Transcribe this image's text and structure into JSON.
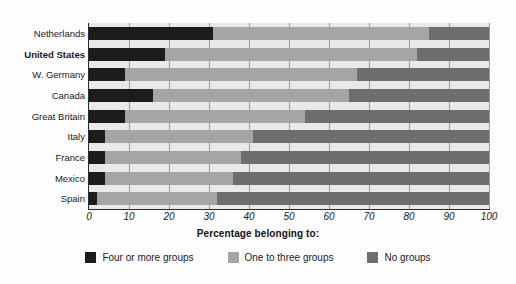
{
  "chart_data": {
    "type": "bar",
    "orientation": "horizontal",
    "stacked": true,
    "title": "",
    "xlabel": "Percentage belonging to:",
    "ylabel": "",
    "xlim": [
      0,
      100
    ],
    "xticks": [
      0,
      10,
      20,
      30,
      40,
      50,
      60,
      70,
      80,
      90,
      100
    ],
    "grid": true,
    "grid_axis": "x",
    "legend_position": "bottom",
    "categories": [
      "Netherlands",
      "United States",
      "W. Germany",
      "Canada",
      "Great Britain",
      "Italy",
      "France",
      "Mexico",
      "Spain"
    ],
    "emphasized_category": "United States",
    "series": [
      {
        "name": "Four or more groups",
        "color": "#1c1c1c",
        "values": [
          31,
          19,
          9,
          16,
          9,
          4,
          4,
          4,
          2
        ]
      },
      {
        "name": "One to three groups",
        "color": "#a5a5a5",
        "values": [
          54,
          63,
          58,
          49,
          45,
          37,
          34,
          32,
          30
        ]
      },
      {
        "name": "No groups",
        "color": "#6e6e6e",
        "values": [
          15,
          18,
          33,
          35,
          46,
          59,
          62,
          64,
          68
        ]
      }
    ]
  },
  "legend": {
    "items": [
      {
        "label": "Four or more groups",
        "color": "#1c1c1c"
      },
      {
        "label": "One to three groups",
        "color": "#a5a5a5"
      },
      {
        "label": "No groups",
        "color": "#6e6e6e"
      }
    ]
  },
  "colors": {
    "plot_background": "#e9e9e9",
    "gridline": "#9a9a9a",
    "axis": "#2b2b2b",
    "text": "#1a1a1a",
    "page_background": "#fdfdfd"
  }
}
